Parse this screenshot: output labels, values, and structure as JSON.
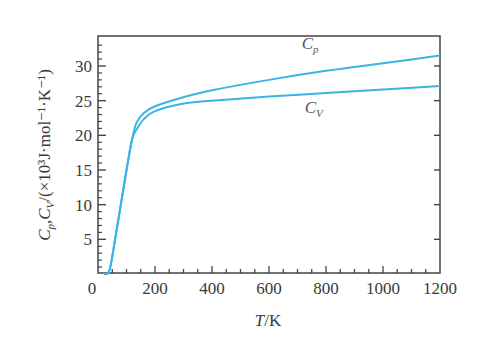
{
  "chart_data": {
    "type": "line",
    "title": "",
    "xlabel": "T/K",
    "ylabel": "Cp,Cv/(×10³J·mol⁻¹·K⁻¹)",
    "xlim": [
      0,
      1200
    ],
    "ylim": [
      0,
      34
    ],
    "grid": false,
    "legend": "inline labels",
    "x_ticks": [
      0,
      200,
      400,
      600,
      800,
      1000,
      1200
    ],
    "y_ticks": [
      5,
      10,
      15,
      20,
      25,
      30
    ],
    "y_zero_label": "0",
    "line_color": "#3ab4e6",
    "series": [
      {
        "name": "Cp",
        "label_main": "C",
        "label_sub": "p",
        "label_pos": [
          715,
          32.5
        ],
        "x": [
          20,
          40,
          60,
          80,
          100,
          120,
          135,
          160,
          200,
          300,
          400,
          600,
          800,
          1000,
          1200
        ],
        "values": [
          0,
          0.5,
          5,
          10,
          15,
          19.5,
          21.8,
          23.2,
          24.2,
          25.5,
          26.5,
          28.0,
          29.3,
          30.4,
          31.5
        ]
      },
      {
        "name": "Cv",
        "label_main": "C",
        "label_sub": "V",
        "label_pos": [
          725,
          23.2
        ],
        "x": [
          20,
          40,
          60,
          80,
          100,
          120,
          135,
          160,
          200,
          300,
          400,
          600,
          800,
          1000,
          1200
        ],
        "values": [
          0,
          0.5,
          5,
          10,
          15,
          19.5,
          20.8,
          22.3,
          23.5,
          24.6,
          25.0,
          25.6,
          26.1,
          26.6,
          27.1
        ]
      }
    ]
  },
  "axes": {
    "x_title_main": "T",
    "x_title_unit": "/K",
    "y_title_text": "C",
    "y_title_p": "p",
    "y_title_mid": ",C",
    "y_title_v": "V",
    "y_title_rest": "/(×10³J·mol⁻¹·K⁻¹)"
  }
}
